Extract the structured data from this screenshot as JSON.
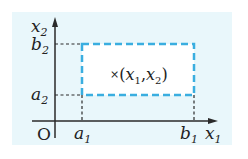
{
  "diagram": {
    "type": "coordinate-region",
    "colors": {
      "panel_background": "#e9f7fb",
      "axis": "#2a2a2a",
      "guide_dashes": "#2a2a2a",
      "region_border": "#3aaee0",
      "text": "#222222"
    },
    "axes": {
      "x_label": "x",
      "x_label_sub": "1",
      "y_label": "x",
      "y_label_sub": "2",
      "origin_label": "O"
    },
    "ticks": {
      "x": [
        {
          "base": "a",
          "sub": "1"
        },
        {
          "base": "b",
          "sub": "1"
        }
      ],
      "y": [
        {
          "base": "a",
          "sub": "2"
        },
        {
          "base": "b",
          "sub": "2"
        }
      ]
    },
    "region": {
      "shape": "dashed-rectangle",
      "x_range": [
        "a1",
        "b1"
      ],
      "y_range": [
        "a2",
        "b2"
      ]
    },
    "point": {
      "marker": "×",
      "open": "(",
      "x_base": "x",
      "x_sub": "1",
      "comma": ",",
      "y_base": "x",
      "y_sub": "2",
      "close": ")"
    }
  }
}
